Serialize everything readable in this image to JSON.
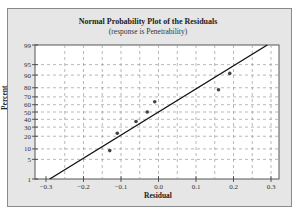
{
  "chart_data": {
    "type": "scatter",
    "title": "Normal Probability Plot of the Residuals",
    "subtitle": "(response is Penetrability)",
    "xlabel": "Residual",
    "ylabel": "Percent",
    "xlim": [
      -0.3,
      0.3
    ],
    "x_ticks": [
      -0.3,
      -0.2,
      -0.1,
      0.0,
      0.1,
      0.2,
      0.3
    ],
    "x_tick_labels": [
      "−0.3",
      "−0.2",
      "−0.1",
      "0.0",
      "0.1",
      "0.2",
      "0.3"
    ],
    "y_scale": "normal-probability",
    "y_ticks": [
      1,
      5,
      10,
      20,
      30,
      40,
      50,
      60,
      70,
      80,
      90,
      95,
      99
    ],
    "grid": true,
    "points": [
      {
        "residual": -0.13,
        "percent": 9
      },
      {
        "residual": -0.11,
        "percent": 23
      },
      {
        "residual": -0.06,
        "percent": 37
      },
      {
        "residual": -0.03,
        "percent": 50
      },
      {
        "residual": -0.01,
        "percent": 64
      },
      {
        "residual": 0.16,
        "percent": 78
      },
      {
        "residual": 0.19,
        "percent": 91
      }
    ],
    "fit_line": {
      "from": {
        "residual": -0.29,
        "percent": 1
      },
      "to": {
        "residual": 0.29,
        "percent": 99
      }
    }
  },
  "colors": {
    "background": "#e6e6e6",
    "plot_bg": "#ffffff",
    "line": "#111111",
    "point": "#444444",
    "grid": "#9a9a9a"
  }
}
